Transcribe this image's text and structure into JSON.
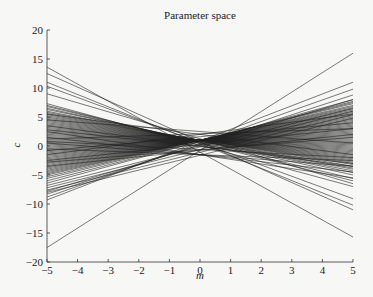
{
  "chart_data": {
    "type": "line",
    "title": "Parameter space",
    "xlabel": "m",
    "ylabel": "c",
    "xlim": [
      -5,
      5
    ],
    "ylim": [
      -20,
      20
    ],
    "xticks": [
      -5,
      -4,
      -3,
      -2,
      -1,
      0,
      1,
      2,
      3,
      4,
      5
    ],
    "yticks": [
      -20,
      -15,
      -10,
      -5,
      0,
      5,
      10,
      15,
      20
    ],
    "grid": false,
    "legend": null,
    "line_color": "#222222",
    "lines_endpoints_note": "each entry is [c at m=-5, c at m=5]",
    "lines": [
      [
        13.6,
        -15.7
      ],
      [
        12.5,
        -11.0
      ],
      [
        11.0,
        -10.2
      ],
      [
        10.3,
        -9.1
      ],
      [
        9.0,
        -6.5
      ],
      [
        -17.5,
        16.0
      ],
      [
        -9.3,
        11.0
      ],
      [
        -8.8,
        9.8
      ],
      [
        -8.3,
        8.8
      ],
      [
        -7.8,
        8.0
      ],
      [
        7.3,
        -7.0
      ],
      [
        7.0,
        -6.0
      ],
      [
        6.8,
        -5.6
      ],
      [
        6.5,
        -5.0
      ],
      [
        6.3,
        -4.6
      ],
      [
        6.0,
        -4.3
      ],
      [
        5.8,
        -4.0
      ],
      [
        5.6,
        -3.8
      ],
      [
        5.4,
        -3.5
      ],
      [
        5.2,
        -3.2
      ],
      [
        5.0,
        -3.0
      ],
      [
        4.8,
        -2.8
      ],
      [
        4.6,
        -2.6
      ],
      [
        4.4,
        -2.4
      ],
      [
        4.2,
        -2.2
      ],
      [
        4.0,
        -2.0
      ],
      [
        3.8,
        -1.8
      ],
      [
        3.6,
        -1.6
      ],
      [
        3.4,
        -1.4
      ],
      [
        3.2,
        -1.2
      ],
      [
        3.0,
        -1.0
      ],
      [
        2.8,
        -0.8
      ],
      [
        2.6,
        -0.6
      ],
      [
        2.4,
        -0.4
      ],
      [
        2.2,
        -0.2
      ],
      [
        2.0,
        0.0
      ],
      [
        1.8,
        0.2
      ],
      [
        1.6,
        0.4
      ],
      [
        1.4,
        0.6
      ],
      [
        1.2,
        0.8
      ],
      [
        1.0,
        1.0
      ],
      [
        0.8,
        1.2
      ],
      [
        0.6,
        1.4
      ],
      [
        0.4,
        1.6
      ],
      [
        0.2,
        1.8
      ],
      [
        0.0,
        2.0
      ],
      [
        -0.2,
        2.2
      ],
      [
        -0.4,
        2.4
      ],
      [
        -0.6,
        2.6
      ],
      [
        -0.8,
        2.8
      ],
      [
        -1.0,
        3.0
      ],
      [
        -1.2,
        3.2
      ],
      [
        -1.4,
        3.4
      ],
      [
        -1.6,
        3.6
      ],
      [
        -1.8,
        3.8
      ],
      [
        -2.0,
        4.0
      ],
      [
        -2.2,
        4.2
      ],
      [
        -2.4,
        4.4
      ],
      [
        -2.6,
        4.6
      ],
      [
        -2.8,
        4.8
      ],
      [
        -3.0,
        5.0
      ],
      [
        -3.2,
        5.2
      ],
      [
        -3.4,
        5.4
      ],
      [
        -3.6,
        5.6
      ],
      [
        -3.8,
        5.8
      ],
      [
        -4.0,
        6.0
      ],
      [
        -4.2,
        6.2
      ],
      [
        -4.4,
        6.4
      ],
      [
        -4.6,
        6.6
      ],
      [
        -4.8,
        6.8
      ],
      [
        -5.0,
        7.0
      ],
      [
        -5.3,
        7.3
      ],
      [
        -5.6,
        7.5
      ],
      [
        -6.0,
        7.7
      ],
      [
        -6.4,
        8.0
      ],
      [
        -6.8,
        6.5
      ],
      [
        -7.2,
        6.0
      ],
      [
        -7.6,
        5.4
      ],
      [
        -8.0,
        4.8
      ],
      [
        1.5,
        -4.5
      ],
      [
        2.5,
        -5.5
      ],
      [
        0.5,
        -3.5
      ],
      [
        -0.5,
        -2.5
      ],
      [
        3.5,
        -3.5
      ],
      [
        -1.5,
        5.5
      ],
      [
        -2.5,
        3.0
      ],
      [
        4.5,
        0.5
      ],
      [
        5.5,
        -1.5
      ],
      [
        -3.5,
        2.0
      ],
      [
        0.8,
        -2.0
      ],
      [
        -0.8,
        4.0
      ],
      [
        2.8,
        -3.0
      ],
      [
        -2.8,
        1.5
      ],
      [
        1.2,
        3.0
      ]
    ]
  }
}
